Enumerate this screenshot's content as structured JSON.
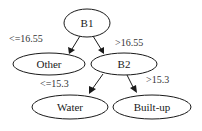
{
  "diagram": {
    "type": "decision-tree",
    "nodes": [
      {
        "id": "b1",
        "label": "B1",
        "cx": 87,
        "cy": 23,
        "rx": 23,
        "ry": 14
      },
      {
        "id": "other",
        "label": "Other",
        "cx": 49,
        "cy": 64,
        "rx": 36,
        "ry": 11
      },
      {
        "id": "b2",
        "label": "B2",
        "cx": 124,
        "cy": 64,
        "rx": 33,
        "ry": 11
      },
      {
        "id": "water",
        "label": "Water",
        "cx": 70,
        "cy": 107,
        "rx": 38,
        "ry": 12
      },
      {
        "id": "builtup",
        "label": "Built-up",
        "cx": 152,
        "cy": 107,
        "rx": 39,
        "ry": 12
      }
    ],
    "edges": [
      {
        "from": "b1",
        "to": "other",
        "label": "<=16.55"
      },
      {
        "from": "b1",
        "to": "b2",
        "label": ">16.55"
      },
      {
        "from": "b2",
        "to": "water",
        "label": "<=15.3"
      },
      {
        "from": "b2",
        "to": "builtup",
        "label": ">15.3"
      }
    ]
  }
}
